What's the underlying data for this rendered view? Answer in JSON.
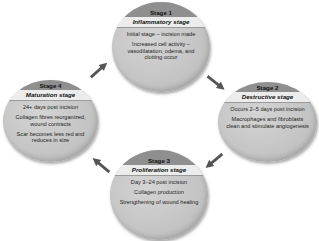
{
  "diagram": {
    "type": "cycle",
    "title": "",
    "colors": {
      "stage_header": "#8f8f8f",
      "stage_name_band": "#ececec",
      "stage_body": "#c8c8c8",
      "arrow": "#555555"
    },
    "stages": [
      {
        "label": "Stage 1",
        "name": "Inflammatory stage",
        "points": [
          "Initial stage – incision made",
          "Increased cell activity – vasodilatation, odema, and clotting occur"
        ]
      },
      {
        "label": "Stage 2",
        "name": "Destructive stage",
        "points": [
          "Occurs 2–5 days post incision",
          "Macrophages and fibroblasts clean and stimulate angiogenesis"
        ]
      },
      {
        "label": "Stage 3",
        "name": "Proliferation stage",
        "points": [
          "Day 3–24 post incision",
          "Collagen production",
          "Strengthening of wound healing"
        ]
      },
      {
        "label": "Stage 4",
        "name": "Maturation stage",
        "points": [
          "24+ days post incision",
          "Collagen fibres reorganized, wound contracts",
          "Scar becomes less red and reduces in size"
        ]
      }
    ],
    "arrows": [
      {
        "from": "Stage 1",
        "to": "Stage 2"
      },
      {
        "from": "Stage 2",
        "to": "Stage 3"
      },
      {
        "from": "Stage 3",
        "to": "Stage 4"
      },
      {
        "from": "Stage 4",
        "to": "Stage 1"
      }
    ]
  }
}
